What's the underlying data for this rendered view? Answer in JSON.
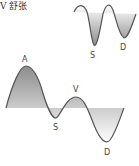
{
  "caption": "V 舒张",
  "top_wave": {
    "labels": {
      "a": "A",
      "v": "V",
      "s": "S",
      "d": "D"
    }
  },
  "bottom_wave": {
    "labels": {
      "a": "A",
      "s": "S",
      "v": "V",
      "d": "D"
    }
  },
  "colors": {
    "stroke": "#555555",
    "fill_dark": "#8a8a8a",
    "fill_light": "#ffffff"
  }
}
